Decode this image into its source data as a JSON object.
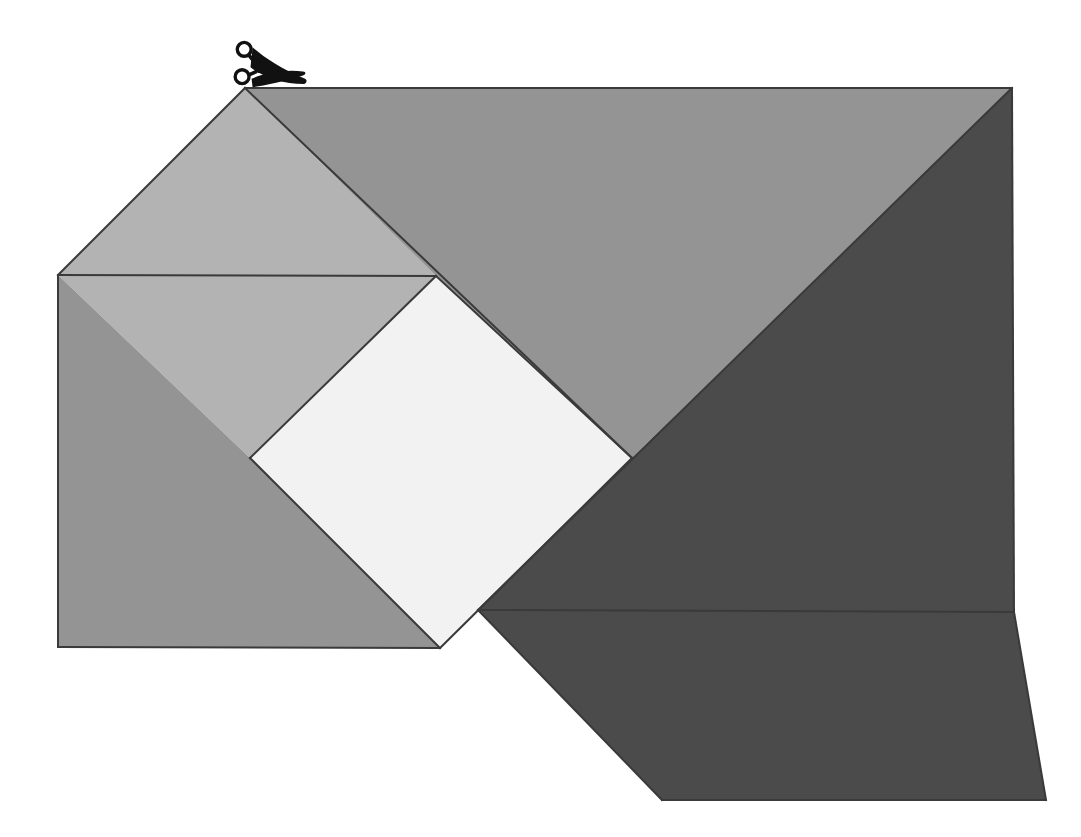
{
  "figure": {
    "background_color": "#ffffff",
    "stroke_color": "#3a3a3a",
    "stroke_width": 2,
    "canvas": {
      "width": 1081,
      "height": 837
    },
    "palette": {
      "light_gray": "#b3b3b3",
      "medium_gray": "#949494",
      "dark_gray": "#4b4b4b",
      "white_piece": "#f2f2f2",
      "outline": "#3a3a3a",
      "scissors": "#111111"
    },
    "key_points": {
      "apex_top": [
        245,
        88
      ],
      "top_right": [
        1012,
        88
      ],
      "left_corner": [
        58,
        275
      ],
      "bottom_left": [
        58,
        647
      ],
      "rect_bottom_right": [
        1014,
        612
      ],
      "square_top": [
        436,
        276
      ],
      "square_right": [
        632,
        458
      ],
      "square_bottom": [
        440,
        648
      ],
      "square_left": [
        250,
        458
      ],
      "dark_tip_left": [
        478,
        610
      ],
      "para_bottom_left": [
        662,
        800
      ],
      "para_bottom_right": [
        1046,
        800
      ]
    },
    "pieces": [
      {
        "name": "upper-left-light-triangle",
        "label": "Light gray triangle at top left",
        "fill": "#b3b3b3",
        "points": "245,88 436,276 250,276 58,275"
      },
      {
        "name": "top-medium-triangle",
        "label": "Medium gray triangle across the top",
        "fill": "#949494",
        "points": "245,88 1012,88 632,458 436,276"
      },
      {
        "name": "left-light-band",
        "label": "Light gray band below the top-left triangle",
        "fill": "#b3b3b3",
        "points": "58,275 436,276 250,458"
      },
      {
        "name": "left-medium-triangle",
        "label": "Medium gray triangle on the left",
        "fill": "#949494",
        "points": "58,275 250,458 440,648 58,647"
      },
      {
        "name": "center-white-square",
        "label": "White square in the center",
        "fill": "#f2f2f2",
        "points": "436,276 632,458 440,648 250,458"
      },
      {
        "name": "right-dark-triangle",
        "label": "Dark gray triangle on the right",
        "fill": "#4b4b4b",
        "points": "1012,88 1014,612 478,610 632,458"
      },
      {
        "name": "bottom-dark-parallelogram",
        "label": "Dark gray parallelogram at the bottom",
        "fill": "#4b4b4b",
        "points": "478,610 1014,612 1046,800 662,800"
      }
    ],
    "cut_lines": [
      {
        "name": "horizontal-cut-line",
        "from": [
          58,
          275
        ],
        "to": [
          436,
          276
        ]
      },
      {
        "name": "square-top-left-edge",
        "from": [
          436,
          276
        ],
        "to": [
          250,
          458
        ]
      },
      {
        "name": "square-bottom-left-edge",
        "from": [
          250,
          458
        ],
        "to": [
          440,
          648
        ]
      },
      {
        "name": "square-top-right-edge",
        "from": [
          436,
          276
        ],
        "to": [
          632,
          458
        ]
      },
      {
        "name": "square-bottom-right-edge",
        "from": [
          632,
          458
        ],
        "to": [
          440,
          648
        ]
      },
      {
        "name": "apex-left-edge",
        "from": [
          245,
          88
        ],
        "to": [
          58,
          275
        ]
      },
      {
        "name": "apex-right-edge",
        "from": [
          245,
          88
        ],
        "to": [
          632,
          458
        ]
      },
      {
        "name": "top-edge",
        "from": [
          245,
          88
        ],
        "to": [
          1012,
          88
        ]
      },
      {
        "name": "right-edge",
        "from": [
          1012,
          88
        ],
        "to": [
          1014,
          612
        ]
      },
      {
        "name": "left-edge",
        "from": [
          58,
          275
        ],
        "to": [
          58,
          647
        ]
      },
      {
        "name": "bottom-left-edge",
        "from": [
          58,
          647
        ],
        "to": [
          440,
          648
        ]
      },
      {
        "name": "dark-diagonal",
        "from": [
          1012,
          88
        ],
        "to": [
          478,
          610
        ]
      },
      {
        "name": "parallelogram-top-edge",
        "from": [
          478,
          610
        ],
        "to": [
          1014,
          612
        ]
      },
      {
        "name": "parallelogram-left-edge",
        "from": [
          478,
          610
        ],
        "to": [
          662,
          800
        ]
      },
      {
        "name": "parallelogram-bottom-edge",
        "from": [
          662,
          800
        ],
        "to": [
          1046,
          800
        ]
      },
      {
        "name": "parallelogram-right-edge",
        "from": [
          1046,
          800
        ],
        "to": [
          1014,
          612
        ]
      }
    ],
    "annotations": [
      {
        "name": "scissors-icon",
        "kind": "scissors-icon",
        "description": "Black scissors marking the cut at the top apex",
        "position": [
          240,
          42
        ],
        "size": [
          68,
          46
        ],
        "color": "#111111"
      }
    ]
  }
}
